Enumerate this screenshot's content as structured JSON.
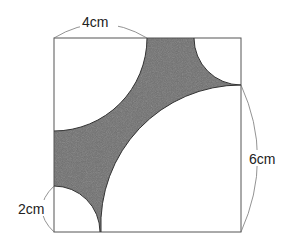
{
  "diagram": {
    "type": "geometry-square-with-quarter-circles",
    "square": {
      "x": 54,
      "y": 38,
      "size": 187
    },
    "scale_px_per_cm": 23.4,
    "shade_color": "#6e6e6e",
    "line_color": "#555555",
    "labels": {
      "top": "4cm",
      "right": "6cm",
      "left": "2cm"
    },
    "arcs": [
      {
        "corner": "top-left",
        "radius_cm": 4
      },
      {
        "corner": "top-right",
        "radius_cm": 2
      },
      {
        "corner": "bottom-right",
        "radius_cm": 6
      },
      {
        "corner": "bottom-left",
        "radius_cm": 2
      }
    ]
  }
}
